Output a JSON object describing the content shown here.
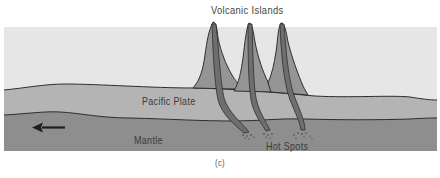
{
  "diagram": {
    "title": "Volcanic Islands",
    "labels": {
      "plate": "Pacific Plate",
      "mantle": "Mantle",
      "hot_spots": "Hot Spots"
    },
    "caption": "(c)",
    "arrow_direction": "left",
    "volcano_count": 3,
    "colors": {
      "ocean": "#e6e6e6",
      "plate": "#b4b4b4",
      "mantle": "#8e8e8e",
      "volcano": "#959595",
      "conduit": "#6e6e6e",
      "outline": "#2e2e2e",
      "text": "#3a3a3a"
    }
  }
}
